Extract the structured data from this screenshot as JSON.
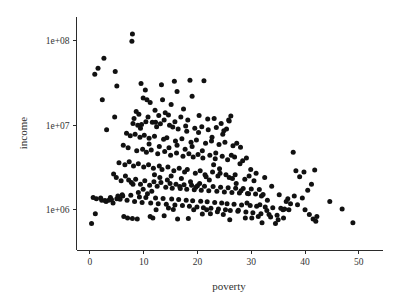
{
  "chart_data": {
    "type": "scatter",
    "title": "",
    "xlabel": "poverty",
    "ylabel": "income",
    "xscale": "linear",
    "yscale": "log",
    "xlim": [
      -2.5,
      54.5
    ],
    "ylim": [
      330000,
      190000000
    ],
    "grid": false,
    "legend": null,
    "marker": {
      "shape": "circle",
      "color": "#111111",
      "size_px": 5
    },
    "xticks": [
      0,
      10,
      20,
      30,
      40,
      50
    ],
    "xtick_labels": [
      "0",
      "10",
      "20",
      "30",
      "40",
      "50"
    ],
    "yticks": [
      1000000,
      10000000,
      100000000
    ],
    "ytick_labels": [
      "1e+06",
      "1e+07",
      "1e+08"
    ],
    "n_points": 301,
    "points": [
      [
        7.9,
        120000000
      ],
      [
        7.8,
        98000000
      ],
      [
        2.6,
        62000000
      ],
      [
        1.5,
        47000000
      ],
      [
        0.9,
        40000000
      ],
      [
        4.7,
        43000000
      ],
      [
        5.0,
        29000000
      ],
      [
        2.3,
        20000000
      ],
      [
        3.1,
        8800000
      ],
      [
        4.6,
        12500000
      ],
      [
        9.5,
        31000000
      ],
      [
        10.3,
        26000000
      ],
      [
        13.3,
        30000000
      ],
      [
        15.7,
        33000000
      ],
      [
        18.6,
        34000000
      ],
      [
        21.2,
        33500000
      ],
      [
        16.2,
        25000000
      ],
      [
        19.0,
        22000000
      ],
      [
        9.9,
        21000000
      ],
      [
        10.6,
        20000000
      ],
      [
        11.2,
        18500000
      ],
      [
        13.5,
        20000000
      ],
      [
        15.1,
        17500000
      ],
      [
        17.4,
        15500000
      ],
      [
        12.1,
        15000000
      ],
      [
        8.6,
        14500000
      ],
      [
        9.1,
        13500000
      ],
      [
        8.2,
        12000000
      ],
      [
        10.8,
        12500000
      ],
      [
        12.8,
        13000000
      ],
      [
        14.0,
        14000000
      ],
      [
        14.6,
        13200000
      ],
      [
        16.9,
        12500000
      ],
      [
        18.2,
        11500000
      ],
      [
        20.3,
        13000000
      ],
      [
        21.9,
        11800000
      ],
      [
        23.1,
        12000000
      ],
      [
        24.4,
        10500000
      ],
      [
        25.8,
        11500000
      ],
      [
        26.2,
        12800000
      ],
      [
        8.0,
        10500000
      ],
      [
        8.9,
        10000000
      ],
      [
        9.6,
        10200000
      ],
      [
        11.6,
        10800000
      ],
      [
        12.4,
        9600000
      ],
      [
        13.1,
        10400000
      ],
      [
        14.8,
        10000000
      ],
      [
        15.4,
        9500000
      ],
      [
        16.4,
        9000000
      ],
      [
        17.8,
        9800000
      ],
      [
        19.5,
        9200000
      ],
      [
        20.8,
        9600000
      ],
      [
        22.0,
        8800000
      ],
      [
        23.5,
        9400000
      ],
      [
        24.9,
        8600000
      ],
      [
        25.4,
        9000000
      ],
      [
        6.8,
        8000000
      ],
      [
        7.5,
        7500000
      ],
      [
        8.4,
        7800000
      ],
      [
        9.3,
        7200000
      ],
      [
        10.1,
        7600000
      ],
      [
        11.0,
        7000000
      ],
      [
        12.0,
        7400000
      ],
      [
        13.7,
        6800000
      ],
      [
        14.3,
        7100000
      ],
      [
        15.9,
        6500000
      ],
      [
        17.1,
        6900000
      ],
      [
        18.8,
        6300000
      ],
      [
        19.8,
        6700000
      ],
      [
        21.5,
        6100000
      ],
      [
        22.6,
        6500000
      ],
      [
        24.0,
        5900000
      ],
      [
        25.1,
        6300000
      ],
      [
        26.6,
        5700000
      ],
      [
        27.3,
        6100000
      ],
      [
        28.0,
        5500000
      ],
      [
        6.2,
        5800000
      ],
      [
        7.1,
        5400000
      ],
      [
        8.7,
        5000000
      ],
      [
        9.8,
        5200000
      ],
      [
        10.5,
        4800000
      ],
      [
        11.4,
        5100000
      ],
      [
        12.6,
        4600000
      ],
      [
        13.9,
        4900000
      ],
      [
        15.0,
        4400000
      ],
      [
        16.1,
        4700000
      ],
      [
        17.3,
        4300000
      ],
      [
        18.4,
        4600000
      ],
      [
        19.2,
        4200000
      ],
      [
        20.1,
        4500000
      ],
      [
        21.0,
        4100000
      ],
      [
        22.3,
        4400000
      ],
      [
        23.3,
        4000000
      ],
      [
        24.6,
        4300000
      ],
      [
        25.6,
        3900000
      ],
      [
        26.9,
        4200000
      ],
      [
        28.4,
        3800000
      ],
      [
        29.1,
        4100000
      ],
      [
        5.4,
        3600000
      ],
      [
        6.5,
        3400000
      ],
      [
        7.3,
        3700000
      ],
      [
        8.1,
        3300000
      ],
      [
        9.0,
        3500000
      ],
      [
        10.0,
        3200000
      ],
      [
        10.9,
        3400000
      ],
      [
        11.8,
        3100000
      ],
      [
        12.9,
        3300000
      ],
      [
        13.4,
        3000000
      ],
      [
        14.5,
        3200000
      ],
      [
        15.6,
        2900000
      ],
      [
        16.6,
        3100000
      ],
      [
        17.6,
        2800000
      ],
      [
        18.1,
        3000000
      ],
      [
        19.6,
        2700000
      ],
      [
        20.5,
        2900000
      ],
      [
        21.4,
        2600000
      ],
      [
        22.8,
        2800000
      ],
      [
        23.8,
        2500000
      ],
      [
        24.2,
        2700000
      ],
      [
        25.9,
        2400000
      ],
      [
        27.0,
        2600000
      ],
      [
        28.8,
        2300000
      ],
      [
        29.6,
        2500000
      ],
      [
        30.5,
        2200000
      ],
      [
        4.9,
        2400000
      ],
      [
        5.8,
        2200000
      ],
      [
        6.6,
        2500000
      ],
      [
        7.7,
        2100000
      ],
      [
        8.5,
        2300000
      ],
      [
        9.4,
        2000000
      ],
      [
        10.2,
        2200000
      ],
      [
        11.1,
        1950000
      ],
      [
        11.9,
        2150000
      ],
      [
        12.5,
        1900000
      ],
      [
        13.2,
        2100000
      ],
      [
        14.1,
        1850000
      ],
      [
        14.9,
        2050000
      ],
      [
        15.3,
        1800000
      ],
      [
        16.0,
        2000000
      ],
      [
        16.8,
        1780000
      ],
      [
        17.5,
        1980000
      ],
      [
        18.0,
        1750000
      ],
      [
        18.9,
        1950000
      ],
      [
        19.4,
        1720000
      ],
      [
        20.0,
        1920000
      ],
      [
        20.7,
        1700000
      ],
      [
        21.3,
        1900000
      ],
      [
        22.1,
        1680000
      ],
      [
        22.9,
        1880000
      ],
      [
        23.6,
        1650000
      ],
      [
        24.3,
        1850000
      ],
      [
        25.0,
        1620000
      ],
      [
        25.7,
        1820000
      ],
      [
        26.4,
        1600000
      ],
      [
        27.1,
        1800000
      ],
      [
        27.8,
        1580000
      ],
      [
        28.5,
        1780000
      ],
      [
        29.3,
        1560000
      ],
      [
        30.0,
        1760000
      ],
      [
        30.8,
        1540000
      ],
      [
        31.5,
        1740000
      ],
      [
        32.2,
        1520000
      ],
      [
        0.6,
        1400000
      ],
      [
        1.2,
        1350000
      ],
      [
        2.2,
        1300000
      ],
      [
        3.0,
        1250000
      ],
      [
        3.8,
        1400000
      ],
      [
        4.3,
        1200000
      ],
      [
        5.2,
        1450000
      ],
      [
        6.0,
        1500000
      ],
      [
        6.9,
        1300000
      ],
      [
        7.6,
        1480000
      ],
      [
        8.3,
        1250000
      ],
      [
        9.2,
        1420000
      ],
      [
        9.7,
        1220000
      ],
      [
        10.4,
        1400000
      ],
      [
        11.3,
        1200000
      ],
      [
        12.2,
        1380000
      ],
      [
        12.7,
        1180000
      ],
      [
        13.6,
        1360000
      ],
      [
        14.2,
        1160000
      ],
      [
        15.2,
        1340000
      ],
      [
        15.8,
        1140000
      ],
      [
        16.5,
        1320000
      ],
      [
        17.2,
        1120000
      ],
      [
        17.9,
        1300000
      ],
      [
        18.5,
        1100000
      ],
      [
        19.1,
        1280000
      ],
      [
        19.9,
        1080000
      ],
      [
        20.6,
        1260000
      ],
      [
        21.1,
        1060000
      ],
      [
        21.8,
        1240000
      ],
      [
        22.5,
        1040000
      ],
      [
        23.2,
        1220000
      ],
      [
        23.9,
        1020000
      ],
      [
        24.5,
        1200000
      ],
      [
        25.2,
        1000000
      ],
      [
        25.5,
        1180000
      ],
      [
        26.1,
        980000
      ],
      [
        26.8,
        1160000
      ],
      [
        27.5,
        960000
      ],
      [
        28.2,
        1140000
      ],
      [
        29.0,
        940000
      ],
      [
        29.8,
        1120000
      ],
      [
        30.3,
        920000
      ],
      [
        31.0,
        1100000
      ],
      [
        31.8,
        900000
      ],
      [
        32.6,
        1080000
      ],
      [
        33.3,
        880000
      ],
      [
        34.0,
        1060000
      ],
      [
        34.8,
        860000
      ],
      [
        35.5,
        1040000
      ],
      [
        36.2,
        1020000
      ],
      [
        37.0,
        1000000
      ],
      [
        37.8,
        4800000
      ],
      [
        38.3,
        2900000
      ],
      [
        39.0,
        2450000
      ],
      [
        39.8,
        2800000
      ],
      [
        40.5,
        1700000
      ],
      [
        41.2,
        2000000
      ],
      [
        41.8,
        2950000
      ],
      [
        42.2,
        830000
      ],
      [
        44.6,
        1250000
      ],
      [
        46.9,
        1020000
      ],
      [
        48.9,
        700000
      ],
      [
        0.3,
        690000
      ],
      [
        1.0,
        900000
      ],
      [
        2.0,
        1380000
      ],
      [
        4.0,
        1320000
      ],
      [
        5.6,
        1330000
      ],
      [
        6.3,
        830000
      ],
      [
        7.0,
        800000
      ],
      [
        7.9,
        790000
      ],
      [
        8.8,
        780000
      ],
      [
        11.7,
        800000
      ],
      [
        12.3,
        1000000
      ],
      [
        15.5,
        1010000
      ],
      [
        16.3,
        780000
      ],
      [
        18.3,
        790000
      ],
      [
        19.3,
        1000000
      ],
      [
        20.9,
        890000
      ],
      [
        22.4,
        900000
      ],
      [
        24.8,
        880000
      ],
      [
        26.0,
        760000
      ],
      [
        27.6,
        990000
      ],
      [
        28.9,
        800000
      ],
      [
        30.1,
        800000
      ],
      [
        31.3,
        830000
      ],
      [
        32.9,
        980000
      ],
      [
        33.6,
        820000
      ],
      [
        34.5,
        690000
      ],
      [
        35.9,
        1000000
      ],
      [
        36.5,
        1250000
      ],
      [
        37.3,
        1180000
      ],
      [
        38.6,
        1150000
      ],
      [
        40.0,
        1000000
      ],
      [
        40.8,
        880000
      ],
      [
        41.5,
        780000
      ],
      [
        42.0,
        730000
      ],
      [
        33.0,
        1300000
      ],
      [
        31.9,
        1450000
      ],
      [
        29.5,
        1550000
      ],
      [
        28.1,
        1680000
      ],
      [
        27.2,
        2050000
      ],
      [
        26.5,
        2350000
      ],
      [
        25.3,
        2600000
      ],
      [
        24.1,
        3050000
      ],
      [
        23.0,
        3400000
      ],
      [
        22.2,
        2250000
      ],
      [
        21.6,
        2450000
      ],
      [
        20.4,
        2050000
      ],
      [
        19.7,
        1850000
      ],
      [
        18.7,
        2150000
      ],
      [
        17.0,
        2350000
      ],
      [
        16.7,
        1880000
      ],
      [
        15.1,
        2500000
      ],
      [
        14.4,
        2250000
      ],
      [
        13.0,
        2400000
      ],
      [
        12.0,
        2600000
      ],
      [
        11.5,
        1650000
      ],
      [
        10.7,
        1550000
      ],
      [
        9.9,
        1750000
      ],
      [
        9.0,
        1600000
      ],
      [
        8.0,
        2000000
      ],
      [
        7.2,
        2250000
      ],
      [
        6.1,
        1450000
      ],
      [
        5.0,
        1350000
      ],
      [
        4.4,
        2650000
      ],
      [
        3.5,
        1300000
      ],
      [
        2.8,
        1290000
      ],
      [
        24.7,
        7800000
      ],
      [
        25.9,
        11200000
      ],
      [
        22.7,
        7200000
      ],
      [
        20.2,
        8200000
      ],
      [
        18.0,
        8500000
      ],
      [
        15.8,
        11000000
      ],
      [
        13.8,
        11500000
      ],
      [
        12.2,
        10800000
      ],
      [
        10.4,
        11000000
      ],
      [
        9.4,
        9200000
      ],
      [
        11.0,
        6000000
      ],
      [
        12.9,
        5600000
      ],
      [
        14.7,
        5400000
      ],
      [
        16.2,
        5800000
      ],
      [
        17.7,
        5200000
      ],
      [
        19.0,
        5600000
      ],
      [
        20.9,
        5000000
      ],
      [
        23.4,
        4700000
      ],
      [
        26.3,
        4400000
      ],
      [
        27.9,
        3500000
      ],
      [
        29.9,
        3000000
      ],
      [
        30.9,
        2700000
      ],
      [
        32.5,
        2400000
      ],
      [
        33.8,
        1900000
      ],
      [
        35.2,
        1500000
      ],
      [
        36.8,
        1350000
      ],
      [
        11.2,
        830000
      ],
      [
        13.8,
        850000
      ],
      [
        14.6,
        1050000
      ],
      [
        21.7,
        1000000
      ],
      [
        23.7,
        950000
      ],
      [
        29.2,
        1200000
      ],
      [
        31.6,
        1150000
      ],
      [
        32.0,
        700000
      ],
      [
        35.0,
        760000
      ],
      [
        36.0,
        800000
      ],
      [
        38.0,
        1450000
      ],
      [
        39.5,
        1380000
      ]
    ]
  },
  "axes": {
    "x_title": "poverty",
    "y_title": "income"
  }
}
